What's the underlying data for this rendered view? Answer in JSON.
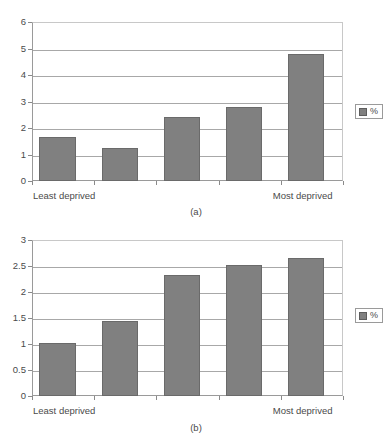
{
  "figure": {
    "background": "#ffffff",
    "bar_color": "#808080",
    "grid_color": "#a8a8a8",
    "axis_color": "#9a9a9a"
  },
  "panels": [
    {
      "id": "a",
      "caption": "(a)",
      "legend": {
        "label": "%",
        "swatch_color": "#808080",
        "position": "right"
      },
      "x_start_label": "Least deprived",
      "x_end_label": "Most deprived",
      "chart_data": {
        "type": "bar",
        "title": "",
        "xlabel": "",
        "ylabel": "",
        "categories": [
          "Least deprived",
          "2",
          "3",
          "4",
          "Most deprived"
        ],
        "values": [
          1.65,
          1.25,
          2.4,
          2.78,
          4.8
        ],
        "ylim": [
          0,
          6
        ],
        "yticks": [
          0,
          1,
          2,
          3,
          4,
          5,
          6
        ],
        "ytick_labels": [
          "0",
          "1",
          "2",
          "3",
          "4",
          "5",
          "6"
        ],
        "grid": true,
        "legend": [
          "%"
        ],
        "legend_position": "right"
      }
    },
    {
      "id": "b",
      "caption": "(b)",
      "legend": {
        "label": "%",
        "swatch_color": "#808080",
        "position": "right"
      },
      "x_start_label": "Least deprived",
      "x_end_label": "Most deprived",
      "chart_data": {
        "type": "bar",
        "title": "",
        "xlabel": "",
        "ylabel": "",
        "categories": [
          "Least deprived",
          "2",
          "3",
          "4",
          "Most deprived"
        ],
        "values": [
          1.01,
          1.45,
          2.32,
          2.52,
          2.65
        ],
        "ylim": [
          0,
          3
        ],
        "yticks": [
          0,
          0.5,
          1,
          1.5,
          2,
          2.5,
          3
        ],
        "ytick_labels": [
          "0",
          "0.5",
          "1",
          "1.5",
          "2",
          "2.5",
          "3"
        ],
        "grid": true,
        "legend": [
          "%"
        ],
        "legend_position": "right"
      }
    }
  ]
}
